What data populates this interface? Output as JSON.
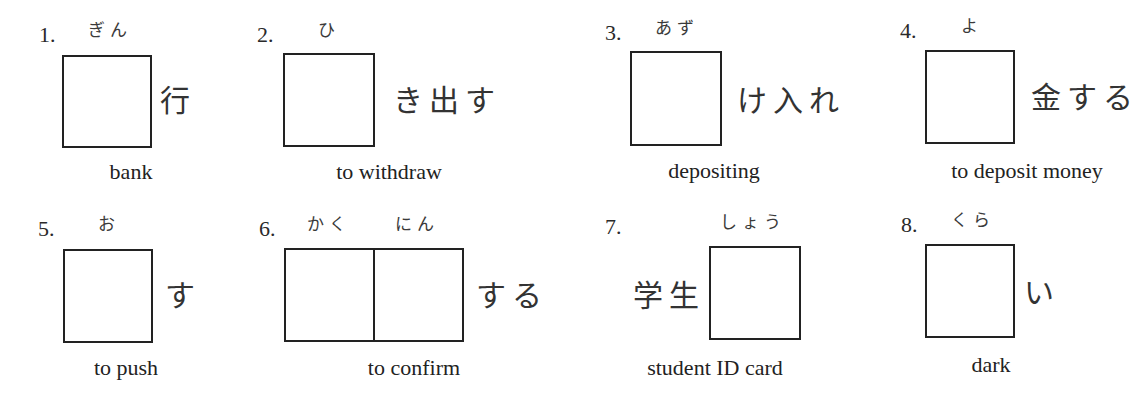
{
  "exercise": {
    "items": [
      {
        "number": "1.",
        "furigana": "ぎん",
        "before_text": "",
        "after_text": "行",
        "boxes": 1,
        "meaning": "bank"
      },
      {
        "number": "2.",
        "furigana": "ひ",
        "before_text": "",
        "after_text": "き出す",
        "boxes": 1,
        "meaning": "to withdraw"
      },
      {
        "number": "3.",
        "furigana": "あず",
        "before_text": "",
        "after_text": "け入れ",
        "boxes": 1,
        "meaning": "depositing"
      },
      {
        "number": "4.",
        "furigana": "よ",
        "before_text": "",
        "after_text": "金する",
        "boxes": 1,
        "meaning": "to deposit money"
      },
      {
        "number": "5.",
        "furigana": "お",
        "before_text": "",
        "after_text": "す",
        "boxes": 1,
        "meaning": "to push"
      },
      {
        "number": "6.",
        "furigana": "かく",
        "furigana_2": "にん",
        "before_text": "",
        "after_text": "する",
        "boxes": 2,
        "meaning": "to confirm"
      },
      {
        "number": "7.",
        "furigana": "しょう",
        "before_text": "学生",
        "after_text": "",
        "boxes": 1,
        "meaning": "student ID card"
      },
      {
        "number": "8.",
        "furigana": "くら",
        "before_text": "",
        "after_text": "い",
        "boxes": 1,
        "meaning": "dark"
      }
    ]
  }
}
